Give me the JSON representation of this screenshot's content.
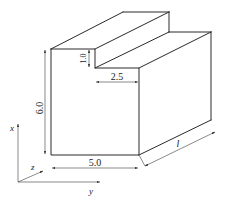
{
  "diagram": {
    "type": "isometric-block-with-step",
    "dimensions": {
      "height": "6.0",
      "step_height": "1.0",
      "step_width": "2.5",
      "width": "5.0",
      "length": "l"
    },
    "axes": {
      "x": "x",
      "y": "y",
      "z": "z"
    },
    "colors": {
      "line": "#2a2a2a",
      "background": "#ffffff"
    }
  }
}
